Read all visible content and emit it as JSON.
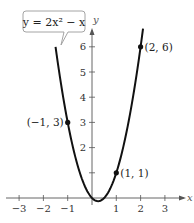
{
  "chart_data": {
    "type": "line",
    "title": "",
    "equation_label": "y = 2x² − x",
    "xlabel": "x",
    "ylabel": "y",
    "xlim": [
      -3.4,
      3.6
    ],
    "ylim": [
      -0.3,
      6.9
    ],
    "x_ticks": [
      -3,
      -2,
      -1,
      1,
      2,
      3
    ],
    "y_ticks": [
      1,
      2,
      3,
      4,
      5,
      6
    ],
    "x_tick_labels": [
      "−3",
      "−2",
      "−1",
      "1",
      "2",
      "3"
    ],
    "y_tick_labels": [
      "",
      "2",
      "3",
      "4",
      "5",
      "6"
    ],
    "grid": false,
    "legend": "none",
    "series": [
      {
        "name": "y = 2x^2 - x",
        "function": "2*x^2 - x",
        "x_range": [
          -1.5,
          2.1
        ],
        "color": "#111111"
      }
    ],
    "points": [
      {
        "x": -1,
        "y": 3,
        "label": "(−1, 3)",
        "label_side": "left"
      },
      {
        "x": 1,
        "y": 1,
        "label": "(1, 1)",
        "label_side": "right"
      },
      {
        "x": 2,
        "y": 6,
        "label": "(2, 6)",
        "label_side": "right"
      }
    ]
  }
}
